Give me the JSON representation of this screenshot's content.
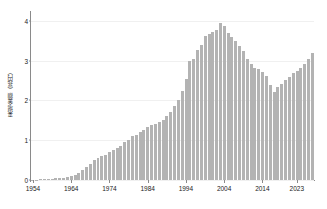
{
  "chart_data": {
    "type": "bar",
    "title": "",
    "xlabel": "",
    "ylabel": "来場金額（兆円）",
    "ylim": [
      0,
      4.2
    ],
    "yticks": [
      0,
      1,
      2,
      3,
      4
    ],
    "ytick_labels": [
      "0",
      "1",
      "2",
      "3",
      "4"
    ],
    "xtick_labels": [
      "1954",
      "1964",
      "1974",
      "1984",
      "1994",
      "2004",
      "2014",
      "2023"
    ],
    "xtick_years": [
      1954,
      1964,
      1974,
      1984,
      1994,
      2004,
      2014,
      2023
    ],
    "grid": true,
    "legend": "none",
    "bar_color": "#b3b3b3",
    "axis_color": "#8a8a8a",
    "gridline_color": "#f0f0f0",
    "text_color": "#1a1a1a",
    "background": "#ffffff",
    "categories": [
      1954,
      1955,
      1956,
      1957,
      1958,
      1959,
      1960,
      1961,
      1962,
      1963,
      1964,
      1965,
      1966,
      1967,
      1968,
      1969,
      1970,
      1971,
      1972,
      1973,
      1974,
      1975,
      1976,
      1977,
      1978,
      1979,
      1980,
      1981,
      1982,
      1983,
      1984,
      1985,
      1986,
      1987,
      1988,
      1989,
      1990,
      1991,
      1992,
      1993,
      1994,
      1995,
      1996,
      1997,
      1998,
      1999,
      2000,
      2001,
      2002,
      2003,
      2004,
      2005,
      2006,
      2007,
      2008,
      2009,
      2010,
      2011,
      2012,
      2013,
      2014,
      2015,
      2016,
      2017,
      2018,
      2019,
      2020,
      2021,
      2022,
      2023
    ],
    "values": [
      0.01,
      0.01,
      0.02,
      0.02,
      0.03,
      0.03,
      0.04,
      0.05,
      0.06,
      0.08,
      0.1,
      0.13,
      0.18,
      0.24,
      0.32,
      0.4,
      0.5,
      0.55,
      0.6,
      0.62,
      0.7,
      0.76,
      0.8,
      0.86,
      0.95,
      1.0,
      1.1,
      1.12,
      1.22,
      1.27,
      1.33,
      1.38,
      1.4,
      1.45,
      1.52,
      1.6,
      1.72,
      1.85,
      2.0,
      2.25,
      2.55,
      3.0,
      3.05,
      3.27,
      3.4,
      3.62,
      3.68,
      3.72,
      3.78,
      3.94,
      3.88,
      3.7,
      3.6,
      3.5,
      3.38,
      3.25,
      3.05,
      2.92,
      2.82,
      2.78,
      2.72,
      2.62,
      2.4,
      2.22,
      2.35,
      2.42,
      2.52,
      2.6,
      2.68,
      2.75
    ],
    "values_tail": [
      2.82,
      2.92,
      3.05,
      3.2
    ],
    "units": "兆円"
  },
  "axis": {
    "y_title": "来場金額（兆円）"
  }
}
